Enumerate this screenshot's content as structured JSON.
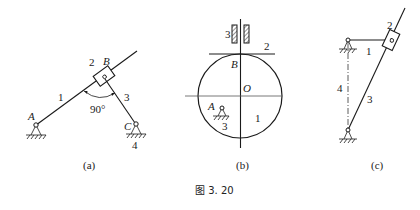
{
  "figure_caption": "图 3. 20",
  "subfigures": [
    {
      "id": "a",
      "caption": "(a)",
      "labels": {
        "link1": "1",
        "slider2": "2",
        "joint_b": "B",
        "link3": "3",
        "joint_a": "A",
        "joint_c": "C",
        "frame4": "4",
        "angle": "90°"
      }
    },
    {
      "id": "b",
      "caption": "(b)",
      "labels": {
        "guide3": "3",
        "follower2": "2",
        "point_b": "B",
        "center_o": "O",
        "pivot_a": "A",
        "cam1": "1",
        "frame3": "3"
      }
    },
    {
      "id": "c",
      "caption": "(c)",
      "labels": {
        "link1": "1",
        "slider2": "2",
        "frame4": "4",
        "link3": "3"
      }
    }
  ],
  "colors": {
    "ink": "#1a1a1a",
    "background": "#ffffff"
  }
}
